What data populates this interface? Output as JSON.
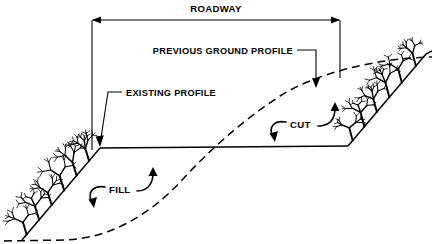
{
  "figure": {
    "kind": "engineering-cross-section",
    "background_color": "#ffffff",
    "line_color": "#000000"
  },
  "labels": {
    "roadway": "ROADWAY",
    "previous_ground_profile": "PREVIOUS GROUND PROFILE",
    "existing_profile": "EXISTING PROFILE",
    "cut": "CUT",
    "fill": "FILL"
  },
  "geometry": {
    "roadway_dimension": {
      "y": 20,
      "x_left": 92,
      "x_right": 340,
      "extension_left_bottom": 150,
      "extension_right_bottom": 78,
      "arrowheads": "both"
    },
    "roadway_surface": {
      "x_left": 100,
      "y_left": 148,
      "x_right": 348,
      "y_right": 146
    },
    "fill_slope": {
      "from_x": 100,
      "from_y": 148,
      "to_x": 22,
      "to_y": 240
    },
    "cut_slope": {
      "from_x": 348,
      "from_y": 146,
      "to_x": 426,
      "to_y": 54
    },
    "previous_ground_curve": "starts bottom-left, runs flat across the fill area, rises through the roadway surface and continues up to the right edge",
    "leader_previous_ground": {
      "from_x": 299,
      "from_y": 50,
      "elbow_x": 316,
      "to_x": 316,
      "to_y": 86
    },
    "leader_existing_profile": {
      "from_x": 121,
      "from_y": 92,
      "elbow_x": 108,
      "to_x": 100,
      "to_y": 145
    }
  },
  "annotations": {
    "cut": {
      "label_x": 291,
      "label_y": 124,
      "arrow_up_right": true,
      "arrow_down_left": true
    },
    "fill": {
      "label_x": 110,
      "label_y": 189,
      "arrow_up_right": true,
      "arrow_down_left": true
    }
  },
  "vegetation": {
    "style": "bare-branching-shrubs",
    "left_slope_count": 6,
    "right_slope_count": 6
  },
  "chart_data": {
    "type": "line",
    "xlabel": "",
    "ylabel": "",
    "series": [
      {
        "name": "EXISTING PROFILE",
        "style": "solid",
        "points": [
          [
            0,
            0.63
          ],
          [
            22,
            0.02
          ],
          [
            100,
            0.39
          ],
          [
            348,
            0.4
          ],
          [
            426,
            0.78
          ],
          [
            432,
            0.8
          ]
        ]
      },
      {
        "name": "PREVIOUS GROUND PROFILE",
        "style": "dashed",
        "points": [
          [
            10,
            0.01
          ],
          [
            60,
            0.02
          ],
          [
            120,
            0.12
          ],
          [
            180,
            0.33
          ],
          [
            215,
            0.4
          ],
          [
            260,
            0.52
          ],
          [
            320,
            0.65
          ],
          [
            380,
            0.73
          ],
          [
            432,
            0.77
          ]
        ]
      }
    ],
    "annotations": [
      "ROADWAY",
      "PREVIOUS GROUND PROFILE",
      "EXISTING PROFILE",
      "CUT",
      "FILL"
    ],
    "grid": false,
    "legend": "none"
  }
}
